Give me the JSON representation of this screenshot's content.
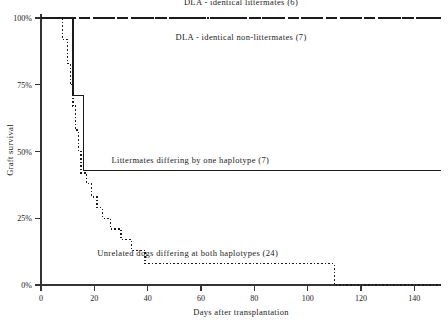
{
  "chart_data": {
    "type": "line",
    "title": "",
    "xlabel": "Days after transplantation",
    "ylabel": "Graft survival",
    "xlim": [
      0,
      150
    ],
    "ylim": [
      0,
      100
    ],
    "xticks": [
      0,
      20,
      40,
      60,
      80,
      100,
      120,
      140
    ],
    "xticklabels": [
      "0",
      "20",
      "40",
      "60",
      "80",
      "100",
      "120",
      "140"
    ],
    "yticks": [
      0,
      25,
      50,
      75,
      100
    ],
    "yticklabels": [
      "0%",
      "25%",
      "50%",
      "75%",
      "100%"
    ],
    "grid": false,
    "legend_position": "inline-annotations",
    "curve_style": "kaplan-meier step",
    "series": [
      {
        "name": "DLA - identical littermates (6)",
        "label": "DLA - identical littermates  (6)",
        "n": 6,
        "linestyle": "dashed",
        "label_x": 75,
        "label_y": 106,
        "x": [
          0,
          150
        ],
        "y": [
          100,
          100
        ]
      },
      {
        "name": "DLA - identical non-littermates (7)",
        "label": "DLA - identical non-littermates (7)",
        "n": 7,
        "linestyle": "dash-dot",
        "label_x": 75,
        "label_y": 93,
        "x": [
          0,
          150
        ],
        "y": [
          100,
          100
        ]
      },
      {
        "name": "Littermates differing by one haplotype (7)",
        "label": "Littermates differing by one haplotype (7)",
        "n": 7,
        "linestyle": "solid",
        "label_x": 56,
        "label_y": 47,
        "x": [
          0,
          12,
          12,
          16,
          16,
          150
        ],
        "y": [
          100,
          100,
          71,
          71,
          43,
          43
        ]
      },
      {
        "name": "Unrelated dogs differing at both haplotypes (24)",
        "label": "Unrelated dogs differing at both haplotypes (24)",
        "n": 24,
        "linestyle": "dotted",
        "label_x": 55,
        "label_y": 12,
        "x": [
          0,
          8,
          8,
          10,
          10,
          11,
          11,
          12,
          12,
          13,
          13,
          14,
          14,
          15,
          15,
          17,
          17,
          19,
          19,
          21,
          21,
          23,
          23,
          26,
          26,
          30,
          30,
          34,
          34,
          39,
          39,
          46,
          46,
          110,
          110,
          150
        ],
        "y": [
          100,
          100,
          92,
          92,
          83,
          83,
          75,
          75,
          67,
          67,
          58,
          58,
          50,
          50,
          42,
          42,
          38,
          38,
          33,
          33,
          29,
          29,
          25,
          25,
          21,
          21,
          17,
          17,
          13,
          13,
          8,
          8,
          8,
          8,
          0,
          0
        ]
      }
    ]
  },
  "caption": {
    "text": "Fig. 1.",
    "visible": true
  },
  "colors": {
    "ink": "#1a1a1a",
    "axis": "#333333",
    "background": "#ffffff"
  }
}
